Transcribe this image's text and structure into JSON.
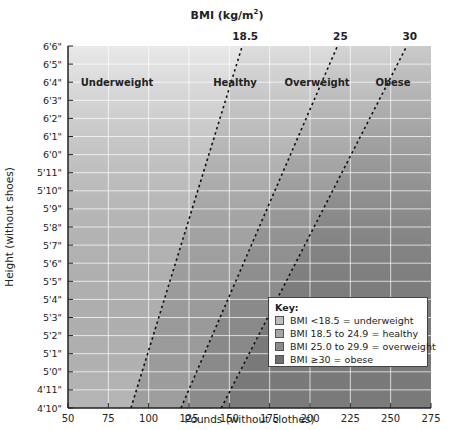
{
  "chart_data": {
    "type": "line",
    "title_text": "BMI (kg/m",
    "title_sup": "2",
    "title_close": ")",
    "xlabel": "Pounds (without clothes)",
    "ylabel": "Height (without shoes)",
    "xlim": [
      50,
      275
    ],
    "x_ticks": [
      50,
      75,
      100,
      125,
      150,
      175,
      200,
      225,
      250,
      275
    ],
    "y_ticks": [
      "4'10\"",
      "4'11\"",
      "5'0\"",
      "5'1\"",
      "5'2\"",
      "5'3\"",
      "5'4\"",
      "5'5\"",
      "5'6\"",
      "5'7\"",
      "5'8\"",
      "5'9\"",
      "5'10\"",
      "5'11\"",
      "6'0\"",
      "6'1\"",
      "6'2\"",
      "6'3\"",
      "6'4\"",
      "6'5\"",
      "6'6\""
    ],
    "ylim_inches": [
      58,
      78
    ],
    "grid": true,
    "series": [
      {
        "name": "BMI 18.5",
        "label": "18.5",
        "points": [
          [
            89,
            58
          ],
          [
            158,
            78
          ]
        ]
      },
      {
        "name": "BMI 25",
        "label": "25",
        "points": [
          [
            120,
            58
          ],
          [
            217,
            78
          ]
        ]
      },
      {
        "name": "BMI 30",
        "label": "30",
        "points": [
          [
            145,
            58
          ],
          [
            260,
            78
          ]
        ]
      }
    ],
    "zones": [
      {
        "label": "Underweight",
        "color": "#cfcfcf"
      },
      {
        "label": "Healthy",
        "color": "#b5b5b5"
      },
      {
        "label": "Overweight",
        "color": "#a0a0a0"
      },
      {
        "label": "Obese",
        "color": "#8c8c8c"
      }
    ],
    "legend": {
      "title": "Key:",
      "position": "lower right",
      "entries": [
        {
          "label": "BMI <18.5 = underweight",
          "color": "#bdbdbd"
        },
        {
          "label": "BMI 18.5 to 24.9 = healthy",
          "color": "#a6a6a6"
        },
        {
          "label": "BMI 25.0 to 29.9 = overweight",
          "color": "#8a8a8a"
        },
        {
          "label": "BMI ≥30 = obese",
          "color": "#6e6e6e"
        }
      ]
    }
  }
}
